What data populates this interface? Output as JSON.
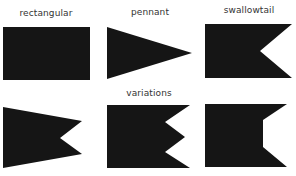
{
  "colors": {
    "shape_fill": "#151515",
    "label_text": "#333333",
    "background": "#ffffff"
  },
  "flags": [
    {
      "id": "rectangular",
      "label": "rectangular",
      "label_pos": [
        46,
        16
      ],
      "points": "3,27 90,27 90,80 3,80"
    },
    {
      "id": "pennant",
      "label": "pennant",
      "label_pos": [
        150,
        15
      ],
      "points": "107,27 192,53 107,79"
    },
    {
      "id": "swallowtail",
      "label": "swallowtail",
      "label_pos": [
        249,
        13
      ],
      "points": "205,24 292,24 260,51 292,78 205,78"
    },
    {
      "id": "variation-pennant-swallowtail",
      "label": "",
      "points": "3,107 82,121 60,138 82,154 3,168"
    },
    {
      "id": "variation-double-notch",
      "label": "variations",
      "label_pos": [
        149,
        96
      ],
      "points": "107,105 190,105 165,122 185,137 165,152 190,168 107,168"
    },
    {
      "id": "variation-flat-notch",
      "label": "",
      "points": "205,104 287,104 263,120 263,147 287,167 205,167"
    }
  ]
}
